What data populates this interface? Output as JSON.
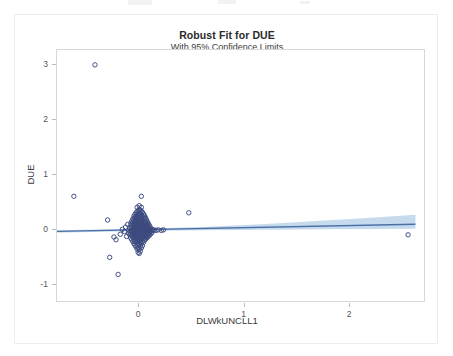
{
  "chart_data": {
    "type": "scatter",
    "title": "Robust Fit for DUE",
    "subtitle": "With 95% Confidence Limits",
    "xlabel": "DLWkUNCLL1",
    "ylabel": "DUE",
    "xlim": [
      -0.78,
      2.72
    ],
    "ylim": [
      -1.32,
      3.28
    ],
    "xticks": [
      0,
      1,
      2
    ],
    "xtick_labels": [
      "0",
      "1",
      "2"
    ],
    "yticks": [
      -1,
      0,
      1,
      2,
      3
    ],
    "ytick_labels": [
      "-1",
      "0",
      "1",
      "2",
      "3"
    ],
    "grid": false,
    "legend": null,
    "marker_style": "open-circle",
    "marker_color": "#3c4a7e",
    "fit_line_color": "#4a6fa5",
    "band_color": "#b6cfe8",
    "fit_line": {
      "name": "Robust fit",
      "intercept": 0.012,
      "slope": 0.038,
      "x_start": -0.78,
      "x_end": 2.62,
      "y_start": -0.018,
      "y_end": 0.112
    },
    "confidence_band": {
      "name": "95% Confidence Limits",
      "level": 95,
      "upper": [
        [
          -0.78,
          0.005
        ],
        [
          0.0,
          0.028
        ],
        [
          0.6,
          0.062
        ],
        [
          1.2,
          0.115
        ],
        [
          1.8,
          0.183
        ],
        [
          2.2,
          0.232
        ],
        [
          2.62,
          0.285
        ]
      ],
      "lower": [
        [
          -0.78,
          -0.042
        ],
        [
          0.0,
          -0.012
        ],
        [
          0.6,
          0.002
        ],
        [
          1.2,
          0.012
        ],
        [
          1.8,
          0.02
        ],
        [
          2.2,
          0.026
        ],
        [
          2.62,
          0.03
        ]
      ]
    },
    "series": [
      {
        "name": "DUE vs DLWkUNCLL1",
        "points": [
          [
            -0.42,
            3.01
          ],
          [
            -0.62,
            0.62
          ],
          [
            0.02,
            0.62
          ],
          [
            0.47,
            0.32
          ],
          [
            2.55,
            -0.08
          ],
          [
            -0.3,
            0.19
          ],
          [
            -0.28,
            -0.49
          ],
          [
            -0.2,
            -0.8
          ],
          [
            -0.24,
            -0.12
          ],
          [
            -0.22,
            -0.17
          ],
          [
            -0.18,
            -0.07
          ],
          [
            -0.16,
            0.02
          ],
          [
            -0.14,
            -0.02
          ],
          [
            -0.13,
            0.06
          ],
          [
            -0.12,
            -0.11
          ],
          [
            -0.11,
            0.11
          ],
          [
            -0.1,
            0.0
          ],
          [
            -0.1,
            -0.05
          ],
          [
            -0.09,
            0.04
          ],
          [
            -0.09,
            -0.08
          ],
          [
            -0.08,
            0.13
          ],
          [
            -0.08,
            0.08
          ],
          [
            -0.08,
            -0.01
          ],
          [
            -0.08,
            -0.06
          ],
          [
            -0.08,
            -0.14
          ],
          [
            -0.07,
            0.17
          ],
          [
            -0.07,
            0.1
          ],
          [
            -0.07,
            0.05
          ],
          [
            -0.07,
            0.0
          ],
          [
            -0.07,
            -0.04
          ],
          [
            -0.07,
            -0.09
          ],
          [
            -0.07,
            -0.17
          ],
          [
            -0.06,
            0.21
          ],
          [
            -0.06,
            0.15
          ],
          [
            -0.06,
            0.09
          ],
          [
            -0.06,
            0.03
          ],
          [
            -0.06,
            -0.02
          ],
          [
            -0.06,
            -0.07
          ],
          [
            -0.06,
            -0.12
          ],
          [
            -0.06,
            -0.2
          ],
          [
            -0.05,
            0.26
          ],
          [
            -0.05,
            0.19
          ],
          [
            -0.05,
            0.12
          ],
          [
            -0.05,
            0.06
          ],
          [
            -0.05,
            0.01
          ],
          [
            -0.05,
            -0.04
          ],
          [
            -0.05,
            -0.1
          ],
          [
            -0.05,
            -0.16
          ],
          [
            -0.05,
            -0.24
          ],
          [
            -0.04,
            0.29
          ],
          [
            -0.04,
            0.23
          ],
          [
            -0.04,
            0.16
          ],
          [
            -0.04,
            0.1
          ],
          [
            -0.04,
            0.04
          ],
          [
            -0.04,
            -0.01
          ],
          [
            -0.04,
            -0.06
          ],
          [
            -0.04,
            -0.12
          ],
          [
            -0.04,
            -0.19
          ],
          [
            -0.04,
            -0.27
          ],
          [
            -0.03,
            0.32
          ],
          [
            -0.03,
            0.25
          ],
          [
            -0.03,
            0.18
          ],
          [
            -0.03,
            0.12
          ],
          [
            -0.03,
            0.07
          ],
          [
            -0.03,
            0.02
          ],
          [
            -0.03,
            -0.03
          ],
          [
            -0.03,
            -0.08
          ],
          [
            -0.03,
            -0.14
          ],
          [
            -0.03,
            -0.21
          ],
          [
            -0.03,
            -0.3
          ],
          [
            -0.02,
            0.34
          ],
          [
            -0.02,
            0.27
          ],
          [
            -0.02,
            0.2
          ],
          [
            -0.02,
            0.14
          ],
          [
            -0.02,
            0.08
          ],
          [
            -0.02,
            0.03
          ],
          [
            -0.02,
            -0.02
          ],
          [
            -0.02,
            -0.07
          ],
          [
            -0.02,
            -0.13
          ],
          [
            -0.02,
            -0.19
          ],
          [
            -0.02,
            -0.26
          ],
          [
            -0.02,
            -0.34
          ],
          [
            -0.01,
            0.36
          ],
          [
            -0.01,
            0.29
          ],
          [
            -0.01,
            0.22
          ],
          [
            -0.01,
            0.16
          ],
          [
            -0.01,
            0.1
          ],
          [
            -0.01,
            0.05
          ],
          [
            -0.01,
            0.0
          ],
          [
            -0.01,
            -0.05
          ],
          [
            -0.01,
            -0.1
          ],
          [
            -0.01,
            -0.16
          ],
          [
            -0.01,
            -0.23
          ],
          [
            -0.01,
            -0.31
          ],
          [
            -0.01,
            -0.4
          ],
          [
            0.0,
            0.38
          ],
          [
            0.0,
            0.31
          ],
          [
            0.0,
            0.24
          ],
          [
            0.0,
            0.18
          ],
          [
            0.0,
            0.12
          ],
          [
            0.0,
            0.07
          ],
          [
            0.0,
            0.02
          ],
          [
            0.0,
            -0.03
          ],
          [
            0.0,
            -0.08
          ],
          [
            0.0,
            -0.13
          ],
          [
            0.0,
            -0.19
          ],
          [
            0.0,
            -0.26
          ],
          [
            0.0,
            -0.34
          ],
          [
            0.0,
            -0.42
          ],
          [
            0.01,
            0.37
          ],
          [
            0.01,
            0.3
          ],
          [
            0.01,
            0.23
          ],
          [
            0.01,
            0.17
          ],
          [
            0.01,
            0.11
          ],
          [
            0.01,
            0.06
          ],
          [
            0.01,
            0.01
          ],
          [
            0.01,
            -0.04
          ],
          [
            0.01,
            -0.09
          ],
          [
            0.01,
            -0.15
          ],
          [
            0.01,
            -0.21
          ],
          [
            0.01,
            -0.29
          ],
          [
            0.01,
            -0.38
          ],
          [
            0.02,
            0.35
          ],
          [
            0.02,
            0.28
          ],
          [
            0.02,
            0.21
          ],
          [
            0.02,
            0.15
          ],
          [
            0.02,
            0.09
          ],
          [
            0.02,
            0.04
          ],
          [
            0.02,
            -0.01
          ],
          [
            0.02,
            -0.06
          ],
          [
            0.02,
            -0.11
          ],
          [
            0.02,
            -0.17
          ],
          [
            0.02,
            -0.24
          ],
          [
            0.02,
            -0.32
          ],
          [
            0.03,
            0.33
          ],
          [
            0.03,
            0.26
          ],
          [
            0.03,
            0.19
          ],
          [
            0.03,
            0.13
          ],
          [
            0.03,
            0.08
          ],
          [
            0.03,
            0.03
          ],
          [
            0.03,
            -0.02
          ],
          [
            0.03,
            -0.07
          ],
          [
            0.03,
            -0.13
          ],
          [
            0.03,
            -0.2
          ],
          [
            0.03,
            -0.28
          ],
          [
            0.04,
            0.3
          ],
          [
            0.04,
            0.24
          ],
          [
            0.04,
            0.17
          ],
          [
            0.04,
            0.11
          ],
          [
            0.04,
            0.06
          ],
          [
            0.04,
            0.01
          ],
          [
            0.04,
            -0.04
          ],
          [
            0.04,
            -0.09
          ],
          [
            0.04,
            -0.15
          ],
          [
            0.04,
            -0.22
          ],
          [
            0.05,
            0.27
          ],
          [
            0.05,
            0.21
          ],
          [
            0.05,
            0.14
          ],
          [
            0.05,
            0.08
          ],
          [
            0.05,
            0.03
          ],
          [
            0.05,
            -0.02
          ],
          [
            0.05,
            -0.07
          ],
          [
            0.05,
            -0.13
          ],
          [
            0.05,
            -0.18
          ],
          [
            0.06,
            0.23
          ],
          [
            0.06,
            0.17
          ],
          [
            0.06,
            0.11
          ],
          [
            0.06,
            0.05
          ],
          [
            0.06,
            0.0
          ],
          [
            0.06,
            -0.05
          ],
          [
            0.06,
            -0.11
          ],
          [
            0.06,
            -0.16
          ],
          [
            0.07,
            0.19
          ],
          [
            0.07,
            0.13
          ],
          [
            0.07,
            0.07
          ],
          [
            0.07,
            0.02
          ],
          [
            0.07,
            -0.03
          ],
          [
            0.07,
            -0.08
          ],
          [
            0.07,
            -0.14
          ],
          [
            0.08,
            0.15
          ],
          [
            0.08,
            0.09
          ],
          [
            0.08,
            0.04
          ],
          [
            0.08,
            -0.01
          ],
          [
            0.08,
            -0.06
          ],
          [
            0.08,
            -0.12
          ],
          [
            0.09,
            0.11
          ],
          [
            0.09,
            0.06
          ],
          [
            0.09,
            0.0
          ],
          [
            0.09,
            -0.05
          ],
          [
            0.09,
            -0.1
          ],
          [
            0.1,
            0.08
          ],
          [
            0.1,
            0.02
          ],
          [
            0.1,
            -0.03
          ],
          [
            0.1,
            -0.08
          ],
          [
            0.11,
            0.04
          ],
          [
            0.11,
            -0.01
          ],
          [
            0.11,
            -0.06
          ],
          [
            0.12,
            0.01
          ],
          [
            0.12,
            -0.04
          ],
          [
            0.13,
            0.0
          ],
          [
            0.14,
            0.01
          ],
          [
            0.16,
            0.0
          ],
          [
            0.18,
            0.01
          ],
          [
            0.21,
            0.0
          ],
          [
            0.23,
            0.01
          ],
          [
            0.02,
            0.42
          ],
          [
            -0.02,
            0.42
          ],
          [
            0.0,
            0.45
          ]
        ]
      }
    ]
  }
}
